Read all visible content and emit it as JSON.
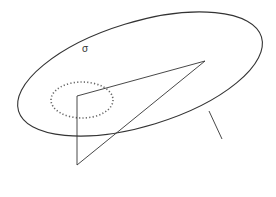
{
  "diagram": {
    "stroke_color": "#333333",
    "dotted_color": "#555555",
    "labels": {
      "sigma": "σ",
      "R": "R",
      "r": "r",
      "r_prime": "r'",
      "ds": "ds",
      "O": "O",
      "arrow": "→"
    }
  }
}
